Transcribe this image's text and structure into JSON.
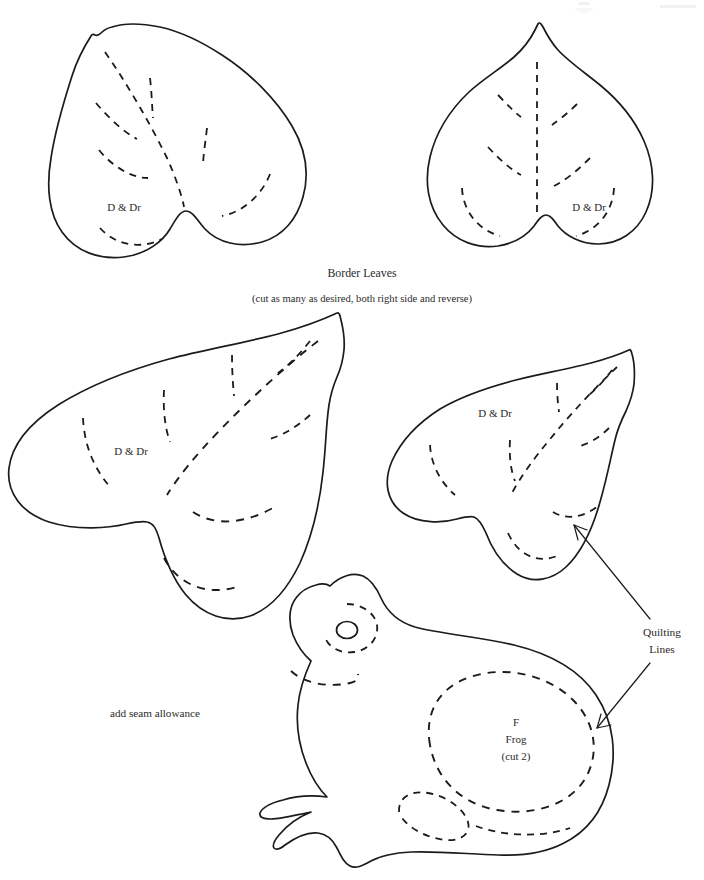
{
  "page": {
    "background_color": "#ffffff",
    "ink_color": "#1b1b1b",
    "text_color": "#2a2a2a",
    "width": 704,
    "height": 880
  },
  "captions": {
    "border_leaves_title": "Border Leaves",
    "border_leaves_subtitle": "(cut as many as desired, both right side and reverse)",
    "seam_allowance_note": "add seam allowance",
    "quilting_lines_line1": "Quilting",
    "quilting_lines_line2": "Lines"
  },
  "pieces": [
    {
      "id": "leaf-top-left",
      "name": "Border Leaf (small, left)",
      "label": "D & Dr",
      "label_x": 124,
      "label_y": 208
    },
    {
      "id": "leaf-top-right",
      "name": "Border Leaf (small, right)",
      "label": "D & Dr",
      "label_x": 589,
      "label_y": 208
    },
    {
      "id": "leaf-large-left",
      "name": "Border Leaf (large, left)",
      "label": "D & Dr",
      "label_x": 131,
      "label_y": 452
    },
    {
      "id": "leaf-mid-right",
      "name": "Border Leaf (medium, right)",
      "label": "D & Dr",
      "label_x": 495,
      "label_y": 414
    },
    {
      "id": "frog-body",
      "name": "Frog body applique piece",
      "label_line1": "F",
      "label_line2": "Frog",
      "label_line3": "(cut 2)",
      "label_x": 516,
      "label_y": 725
    }
  ],
  "annotations": {
    "quilting_lines_text_x": 662,
    "quilting_lines_text_y1": 633,
    "quilting_lines_text_y2": 649,
    "arrow_count": 2
  },
  "legend": {
    "solid_line_meaning": "cutting outline",
    "dashed_line_meaning": "quilting lines"
  }
}
